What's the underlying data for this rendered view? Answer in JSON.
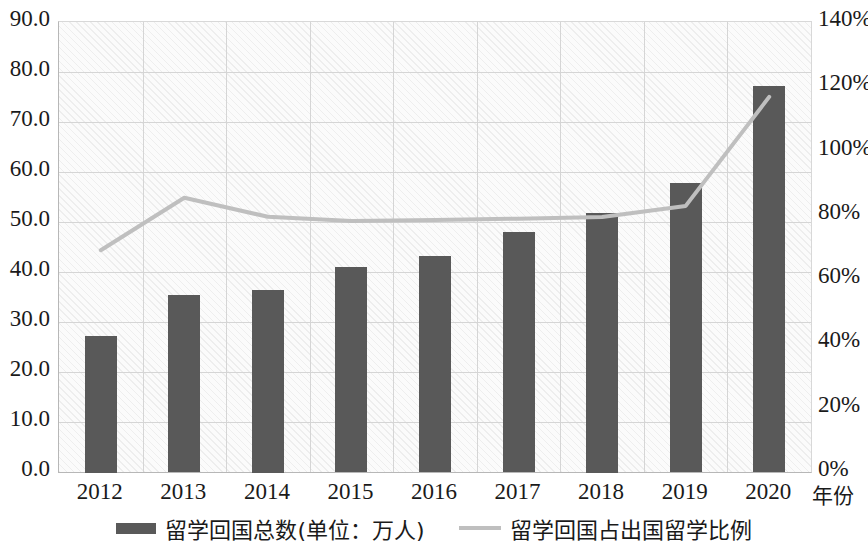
{
  "chart_data": {
    "type": "bar",
    "title": "",
    "subtitle": "",
    "xlabel": "年份",
    "categories": [
      "2012",
      "2013",
      "2014",
      "2015",
      "2016",
      "2017",
      "2018",
      "2019",
      "2020"
    ],
    "grid": true,
    "legend_position": "bottom",
    "axes": {
      "left": {
        "label": "",
        "ylim": [
          0.0,
          90.0
        ],
        "tick_step": 10.0,
        "ticks": [
          "0.0",
          "10.0",
          "20.0",
          "30.0",
          "40.0",
          "50.0",
          "60.0",
          "70.0",
          "80.0",
          "90.0"
        ]
      },
      "right": {
        "label": "",
        "ylim": [
          0,
          140
        ],
        "tick_step": 20,
        "ticks": [
          "0%",
          "20%",
          "40%",
          "60%",
          "80%",
          "100%",
          "120%",
          "140%"
        ]
      }
    },
    "series": [
      {
        "name": "留学回国总数(单位：万人)",
        "type": "bar",
        "axis": "left",
        "color": "#595959",
        "values": [
          27.3,
          35.4,
          36.5,
          41.0,
          43.2,
          48.0,
          51.9,
          57.7,
          77.2
        ]
      },
      {
        "name": "留学回国占出国留学比例",
        "type": "line",
        "axis": "right",
        "color": "#bfbfbf",
        "values": [
          69.0,
          85.3,
          79.4,
          78.1,
          78.4,
          78.8,
          79.3,
          82.8,
          116.7
        ]
      }
    ]
  },
  "legend": {
    "items": [
      {
        "label": "留学回国总数(单位：万人)",
        "marker": "bar-swatch"
      },
      {
        "label": "留学回国占出国留学比例",
        "marker": "line-swatch"
      }
    ]
  }
}
